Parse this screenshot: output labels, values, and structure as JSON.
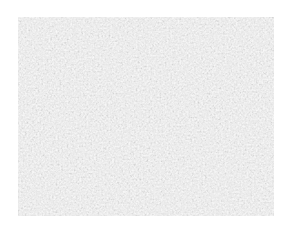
{
  "image": {
    "description": "grayscale speckled gravel texture",
    "colors": {
      "background": "#ffffff",
      "base": "#d9d9d9",
      "light": "#f2f2f2",
      "dark": "#8c8c8c"
    }
  }
}
